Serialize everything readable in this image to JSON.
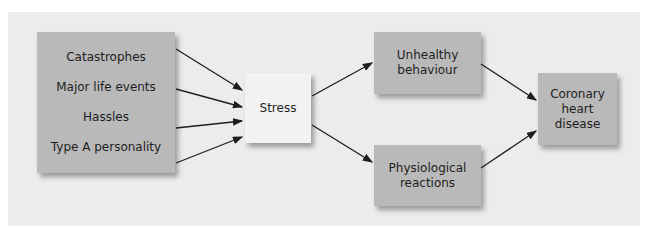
{
  "diagram": {
    "causes": [
      "Catastrophes",
      "Major life events",
      "Hassles",
      "Type A personality"
    ],
    "stress": "Stress",
    "unhealthy": [
      "Unhealthy",
      "behaviour"
    ],
    "physiological": [
      "Physiological",
      "reactions"
    ],
    "outcome": [
      "Coronary",
      "heart",
      "disease"
    ]
  },
  "colors": {
    "panel": "#ececec",
    "box": "#b9b9b9",
    "stress_box": "#f2f2f2",
    "arrow": "#1e1e1e"
  }
}
